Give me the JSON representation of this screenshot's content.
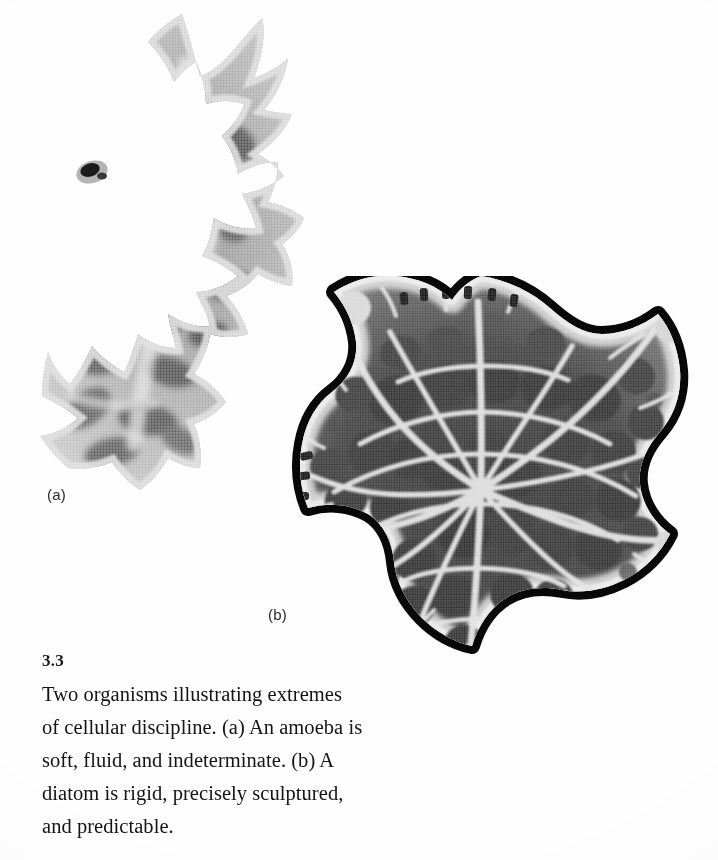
{
  "figure": {
    "number": "3.3",
    "caption": "Two organisms illustrating extremes of cellular discipline. (a) An amoeba is soft, fluid, and indeterminate. (b) A diatom is rigid, precisely sculptured, and predictable.",
    "caption_lines": [
      "Two organisms illustrating extremes",
      "of cellular discipline. (a) An amoeba is",
      "soft, fluid, and indeterminate. (b) A",
      "diatom is rigid, precisely sculptured,",
      "and predictable."
    ],
    "panels": [
      {
        "id": "a",
        "label": "(a)",
        "subject": "amoeba",
        "description": "soft, fluid, and indeterminate",
        "image_kind": "grayscale halftone micrograph"
      },
      {
        "id": "b",
        "label": "(b)",
        "subject": "diatom",
        "description": "rigid, precisely sculptured, and predictable",
        "image_kind": "grayscale halftone micrograph"
      }
    ]
  },
  "colors": {
    "page_background": "#fefefe",
    "text": "#141414",
    "caption_number": "#000000",
    "amoeba_light": "#cfcfcf",
    "amoeba_mid": "#9a9a9a",
    "amoeba_dark": "#4a4a4a",
    "diatom_rib": "#e8e8e8",
    "diatom_cell": "#3b3b3b",
    "diatom_outline": "#080808"
  }
}
